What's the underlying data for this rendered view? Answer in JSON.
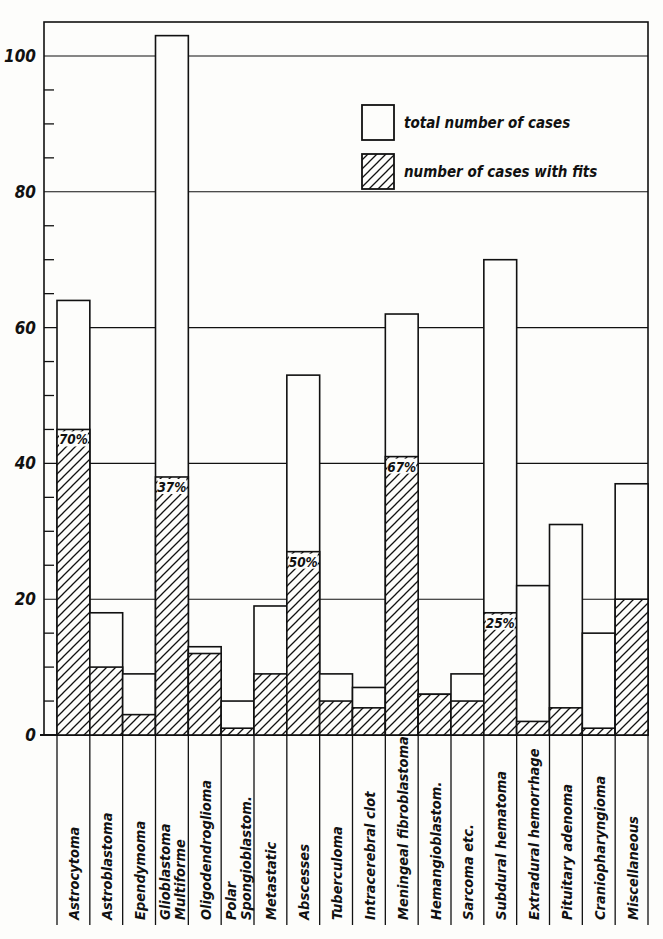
{
  "chart_data": {
    "type": "bar",
    "subtype": "overlaid-bar",
    "title": "",
    "xlabel": "",
    "ylabel": "",
    "ylim": [
      0,
      105
    ],
    "yticks_major": [
      0,
      20,
      40,
      60,
      80,
      100
    ],
    "yticks_minor_step": 5,
    "grid": true,
    "legend_position": "upper-right (inside plot)",
    "categories": [
      "Astrocytoma",
      "Astroblastoma",
      "Ependymoma",
      "Glioblastoma Multiforme",
      "Oligodendroglioma",
      "Polar Spongioblastom.",
      "Metastatic",
      "Abscesses",
      "Tuberculoma",
      "Intracerebral clot",
      "Meningeal fibroblastoma",
      "Hemangioblastom.",
      "Sarcoma etc.",
      "Subdural hematoma",
      "Extradural hemorrhage",
      "Pituitary adenoma",
      "Craniopharyngioma",
      "Miscellaneous"
    ],
    "label_lines": [
      [
        "Astrocytoma"
      ],
      [
        "Astroblastoma"
      ],
      [
        "Ependymoma"
      ],
      [
        "Glioblastoma",
        "Multiforme"
      ],
      [
        "Oligodendroglioma"
      ],
      [
        "Polar",
        "Spongioblastom."
      ],
      [
        "Metastatic"
      ],
      [
        "Abscesses"
      ],
      [
        "Tuberculoma"
      ],
      [
        "Intracerebral clot"
      ],
      [
        "Meningeal fibroblastoma"
      ],
      [
        "Hemangioblastom."
      ],
      [
        "Sarcoma etc."
      ],
      [
        "Subdural hematoma"
      ],
      [
        "Extradural hemorrhage"
      ],
      [
        "Pituitary adenoma"
      ],
      [
        "Craniopharyngioma"
      ],
      [
        "Miscellaneous"
      ]
    ],
    "series": [
      {
        "name": "total number of cases",
        "fill": "white",
        "values": [
          64,
          18,
          9,
          103,
          13,
          5,
          19,
          53,
          9,
          7,
          62,
          6,
          9,
          70,
          22,
          31,
          15,
          37
        ]
      },
      {
        "name": "number of cases with fits",
        "fill": "hatched",
        "values": [
          45,
          10,
          3,
          38,
          12,
          1,
          9,
          27,
          5,
          4,
          41,
          6,
          5,
          18,
          2,
          4,
          1,
          20
        ]
      }
    ],
    "annotations": [
      {
        "category": "Astrocytoma",
        "text": "70%"
      },
      {
        "category": "Glioblastoma Multiforme",
        "text": "37%"
      },
      {
        "category": "Abscesses",
        "text": "50%"
      },
      {
        "category": "Meningeal fibroblastoma",
        "text": "67%"
      },
      {
        "category": "Subdural hematoma",
        "text": "25%"
      }
    ]
  },
  "legend": {
    "items": [
      {
        "label": "total number of cases",
        "swatch": "white"
      },
      {
        "label": "number of cases with fits",
        "swatch": "hatched"
      }
    ]
  },
  "axis": {
    "y_tick_labels": [
      "0",
      "20",
      "40",
      "60",
      "80",
      "100"
    ]
  },
  "colors": {
    "ink": "#111111",
    "paper": "#fdfdfb"
  }
}
